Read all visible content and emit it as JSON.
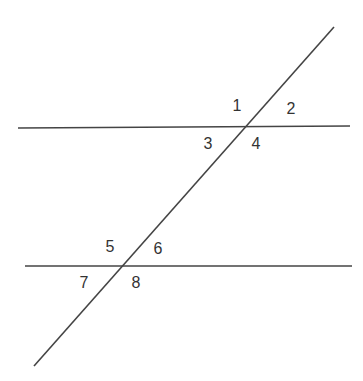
{
  "diagram": {
    "stroke_color": "#444444",
    "lines": [
      {
        "name": "upper-parallel-line",
        "x1": 18,
        "y1": 128,
        "x2": 350,
        "y2": 126
      },
      {
        "name": "lower-parallel-line",
        "x1": 25,
        "y1": 266,
        "x2": 352,
        "y2": 266
      },
      {
        "name": "transversal-line",
        "x1": 334,
        "y1": 27,
        "x2": 34,
        "y2": 366
      }
    ],
    "angle_labels": [
      {
        "text": "1",
        "x": 237,
        "y": 106
      },
      {
        "text": "2",
        "x": 291,
        "y": 109
      },
      {
        "text": "3",
        "x": 208,
        "y": 144
      },
      {
        "text": "4",
        "x": 256,
        "y": 144
      },
      {
        "text": "5",
        "x": 110,
        "y": 247
      },
      {
        "text": "6",
        "x": 158,
        "y": 249
      },
      {
        "text": "7",
        "x": 84,
        "y": 283
      },
      {
        "text": "8",
        "x": 136,
        "y": 283
      }
    ]
  }
}
